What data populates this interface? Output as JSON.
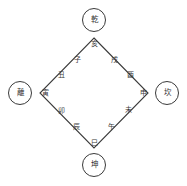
{
  "diagram": {
    "background_color": "#ffffff",
    "line_color": "#3a3a3a",
    "text_color": "#2a2a2a",
    "trigrams": [
      {
        "id": "qian",
        "label": "乾",
        "position": "top",
        "cx": 94,
        "cy": 20
      },
      {
        "id": "kan",
        "label": "坎",
        "position": "right",
        "cx": 167,
        "cy": 93
      },
      {
        "id": "kun",
        "label": "坤",
        "position": "bottom",
        "cx": 94,
        "cy": 165
      },
      {
        "id": "li",
        "label": "離",
        "position": "left",
        "cx": 20,
        "cy": 93
      }
    ],
    "branches": [
      {
        "id": "hai",
        "label": "亥",
        "edge": "top-vertex",
        "x": 94,
        "y": 44
      },
      {
        "id": "xu",
        "label": "戌",
        "edge": "upper-right",
        "x": 114,
        "y": 60
      },
      {
        "id": "you",
        "label": "酉",
        "edge": "upper-right",
        "x": 130,
        "y": 75
      },
      {
        "id": "shen",
        "label": "申",
        "edge": "right-vertex",
        "x": 143,
        "y": 93
      },
      {
        "id": "wei",
        "label": "未",
        "edge": "lower-right",
        "x": 128,
        "y": 110
      },
      {
        "id": "wu",
        "label": "午",
        "edge": "lower-right",
        "x": 111,
        "y": 127
      },
      {
        "id": "si",
        "label": "巳",
        "edge": "bottom-vertex",
        "x": 94,
        "y": 143
      },
      {
        "id": "chen",
        "label": "辰",
        "edge": "lower-left",
        "x": 76,
        "y": 127
      },
      {
        "id": "mao",
        "label": "卯",
        "edge": "lower-left",
        "x": 61,
        "y": 111
      },
      {
        "id": "yin",
        "label": "寅",
        "edge": "left-vertex",
        "x": 45,
        "y": 93
      },
      {
        "id": "chou",
        "label": "丑",
        "edge": "upper-left",
        "x": 61,
        "y": 75
      },
      {
        "id": "zi",
        "label": "子",
        "edge": "upper-left",
        "x": 77,
        "y": 60
      }
    ],
    "geometry": {
      "diamond": {
        "top": {
          "x": 94,
          "y": 38
        },
        "right": {
          "x": 148,
          "y": 93
        },
        "bottom": {
          "x": 94,
          "y": 148
        },
        "left": {
          "x": 40,
          "y": 93
        }
      },
      "circle_radius": 11.5
    }
  }
}
